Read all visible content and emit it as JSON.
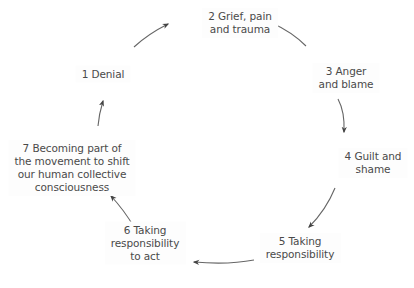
{
  "diagram": {
    "type": "cycle",
    "nodes": [
      {
        "id": 1,
        "lines": [
          "1 Denial"
        ],
        "x": 103,
        "y": 74
      },
      {
        "id": 2,
        "lines": [
          "2 Grief, pain",
          "and trauma"
        ],
        "x": 240,
        "y": 23
      },
      {
        "id": 3,
        "lines": [
          "3 Anger",
          "and blame"
        ],
        "x": 346,
        "y": 78
      },
      {
        "id": 4,
        "lines": [
          "4 Guilt and",
          "shame"
        ],
        "x": 373,
        "y": 163
      },
      {
        "id": 5,
        "lines": [
          "5 Taking",
          "responsibility"
        ],
        "x": 300,
        "y": 248
      },
      {
        "id": 6,
        "lines": [
          "6 Taking",
          "responsibility",
          "to act"
        ],
        "x": 145,
        "y": 243
      },
      {
        "id": 7,
        "lines": [
          "7 Becoming part of",
          "the movement to shift",
          "our human collective",
          "consciousness"
        ],
        "x": 72,
        "y": 168
      }
    ],
    "edges": [
      {
        "from": 1,
        "to": 2
      },
      {
        "from": 3,
        "to": 2
      },
      {
        "from": 3,
        "to": 4
      },
      {
        "from": 4,
        "to": 5
      },
      {
        "from": 5,
        "to": 6
      },
      {
        "from": 6,
        "to": 7
      },
      {
        "from": 7,
        "to": 1
      }
    ],
    "colors": {
      "text": "#4a4a4a",
      "arrow": "#555555",
      "background": "#ffffff"
    }
  }
}
